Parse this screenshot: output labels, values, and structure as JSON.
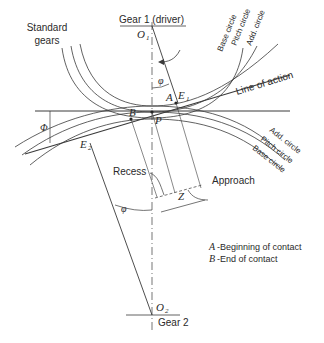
{
  "labels": {
    "standard_gears_1": "Standard",
    "standard_gears_2": "gears",
    "gear1": "Gear 1 (driver)",
    "o1": "O",
    "o1_sub": "1",
    "phi_top": "φ",
    "phi_left": "Φ",
    "phi_bottom": "φ",
    "a": "A",
    "e1": "E",
    "e1_sub": "1",
    "b": "B",
    "p": "P",
    "e2": "E",
    "e2_sub": "2",
    "line_of_action": "Line of action",
    "recess": "Recess",
    "approach": "Approach",
    "z": "Z",
    "o2": "O",
    "o2_sub": "2",
    "gear2": "Gear 2"
  },
  "gear1_circles": {
    "base": "Base circle",
    "pitch": "Pitch circle",
    "add": "Add. circle"
  },
  "gear2_circles": {
    "add": "Add. circle",
    "pitch": "Pitch circle",
    "base": "Base circle"
  },
  "legend": {
    "a_key": "A",
    "a_text": "-Beginning of contact",
    "b_key": "B",
    "b_text": "-End of contact"
  }
}
